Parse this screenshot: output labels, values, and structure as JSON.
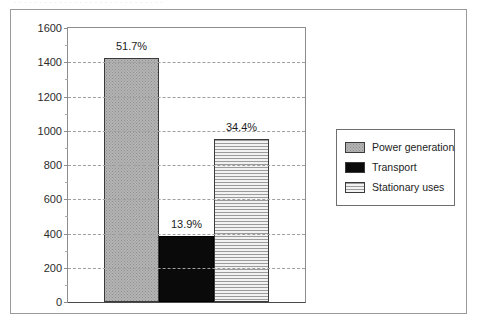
{
  "bleed_text": ". . .   . . . .   . .  . .  . .   . . . . .   . . . .   . . . . . .   . .",
  "chart_data": {
    "type": "bar",
    "title": "",
    "xlabel": "",
    "ylabel": "",
    "ylim": [
      0,
      1600
    ],
    "grid": true,
    "legend_position": "right",
    "categories": [
      "Power generation",
      "Transport",
      "Stationary uses"
    ],
    "values": [
      1425,
      385,
      950
    ],
    "data_labels": [
      "51.7%",
      "13.9%",
      "34.4%"
    ],
    "y_ticks": [
      0,
      200,
      400,
      600,
      800,
      1000,
      1200,
      1400,
      1600
    ],
    "y_tick_labels": [
      "0",
      "200",
      "400",
      "600",
      "800",
      "1000",
      "1200",
      "1400",
      "1600"
    ],
    "series": [
      {
        "name": "Power generation",
        "value": 1425,
        "label": "51.7%",
        "fill": "dotted-gray",
        "color": "#b4b4b4"
      },
      {
        "name": "Transport",
        "value": 385,
        "label": "13.9%",
        "fill": "solid-black",
        "color": "#0a0a0a"
      },
      {
        "name": "Stationary uses",
        "value": 950,
        "label": "34.4%",
        "fill": "horizontal-lines",
        "color": "#9b9b9b"
      }
    ]
  },
  "legend": {
    "items": [
      {
        "label": "Power generation",
        "fill": "dotted-gray"
      },
      {
        "label": "Transport",
        "fill": "solid-black"
      },
      {
        "label": "Stationary uses",
        "fill": "horizontal-lines"
      }
    ]
  },
  "colors": {
    "frame_border": "#9a9a9a",
    "axis": "#8d8d8d",
    "gridline": "#9f9f9f",
    "bar_outline": "#3a3a3a",
    "text": "#1d1d1d",
    "background": "#ffffff"
  }
}
